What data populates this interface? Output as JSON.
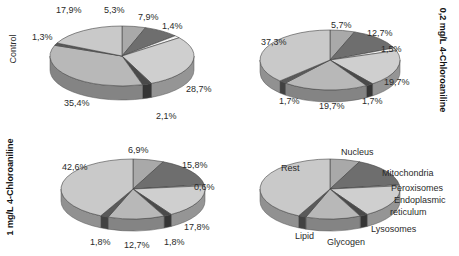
{
  "chart_data": [
    {
      "type": "pie",
      "title": "Control",
      "categories": [
        "Nucleus",
        "Mitochondria",
        "Peroxisomes",
        "Endoplasmic reticulum",
        "Lysosomes",
        "Glycogen",
        "Lipid",
        "Rest"
      ],
      "values": [
        5.3,
        7.9,
        1.4,
        28.7,
        2.1,
        35.4,
        1.3,
        17.9
      ],
      "labels": [
        "5,3%",
        "7,9%",
        "1,4%",
        "28,7%",
        "2,1%",
        "35,4%",
        "1,3%",
        "17,9%"
      ],
      "style": "3d-pie"
    },
    {
      "type": "pie",
      "title": "0,2 mg/L 4-Chloroaniline",
      "categories": [
        "Nucleus",
        "Mitochondria",
        "Peroxisomes",
        "Endoplasmic reticulum",
        "Lysosomes",
        "Glycogen",
        "Lipid",
        "Rest"
      ],
      "values": [
        5.7,
        12.7,
        1.5,
        19.7,
        1.7,
        19.7,
        1.7,
        37.3
      ],
      "labels": [
        "5,7%",
        "12,7%",
        "1,5%",
        "19,7%",
        "1,7%",
        "19,7%",
        "1,7%",
        "37,3%"
      ],
      "style": "3d-pie"
    },
    {
      "type": "pie",
      "title": "1 mg/L 4-Chloroaniline",
      "categories": [
        "Nucleus",
        "Mitochondria",
        "Peroxisomes",
        "Endoplasmic reticulum",
        "Lysosomes",
        "Glycogen",
        "Lipid",
        "Rest"
      ],
      "values": [
        6.9,
        15.8,
        0.6,
        17.8,
        1.8,
        12.7,
        1.8,
        42.6
      ],
      "labels": [
        "6,9%",
        "15,8%",
        "0,6%",
        "17,8%",
        "1,8%",
        "12,7%",
        "1,8%",
        "42,6%"
      ],
      "style": "3d-pie"
    },
    {
      "type": "pie",
      "title": "Legend",
      "categories": [
        "Nucleus",
        "Mitochondria",
        "Peroxisomes",
        "Endoplasmic reticulum",
        "Lysosomes",
        "Glycogen",
        "Lipid",
        "Rest"
      ],
      "values": [
        6.9,
        15.8,
        0.6,
        17.8,
        1.8,
        12.7,
        1.8,
        42.6
      ],
      "labels": [
        "Nucleus",
        "Mitochondria",
        "Peroxisomes",
        "Endoplasmic\nreticulum",
        "Lysosomes",
        "Glycogen",
        "Lipid",
        "Rest"
      ],
      "style": "3d-pie"
    }
  ],
  "slice_colors": {
    "Nucleus": "#a9a9a9",
    "Mitochondria": "#6e6e6e",
    "Peroxisomes": "#f4f4f4",
    "Endoplasmic reticulum": "#cfcfcf",
    "Lysosomes": "#4a4a4a",
    "Glycogen": "#b8b8b8",
    "Lipid": "#5a5a5a",
    "Rest": "#c9c9c9"
  },
  "panels": {
    "control": {
      "row_label": "Control",
      "label_positions": [
        [
          104,
          5
        ],
        [
          138,
          12
        ],
        [
          162,
          21
        ],
        [
          186,
          84
        ],
        [
          156,
          111
        ],
        [
          64,
          98
        ],
        [
          32,
          32
        ],
        [
          56,
          5
        ]
      ]
    },
    "low_dose": {
      "row_label": "0,2 mg/L 4-Chloroaniline",
      "label_positions": [
        [
          331,
          20
        ],
        [
          367,
          28
        ],
        [
          381,
          44
        ],
        [
          384,
          77
        ],
        [
          362,
          96
        ],
        [
          319,
          101
        ],
        [
          279,
          96
        ],
        [
          261,
          37
        ]
      ]
    },
    "high_dose": {
      "row_label": "1 mg/L 4-Chloroaniline",
      "label_positions": [
        [
          128,
          145
        ],
        [
          182,
          160
        ],
        [
          194,
          182
        ],
        [
          184,
          222
        ],
        [
          164,
          237
        ],
        [
          124,
          240
        ],
        [
          90,
          237
        ],
        [
          62,
          162
        ]
      ]
    },
    "legend": {
      "label_positions": [
        [
          341,
          147
        ],
        [
          382,
          168
        ],
        [
          391,
          183
        ],
        [
          394,
          195
        ],
        [
          371,
          224
        ],
        [
          327,
          237
        ],
        [
          295,
          231
        ],
        [
          281,
          163
        ]
      ]
    }
  }
}
